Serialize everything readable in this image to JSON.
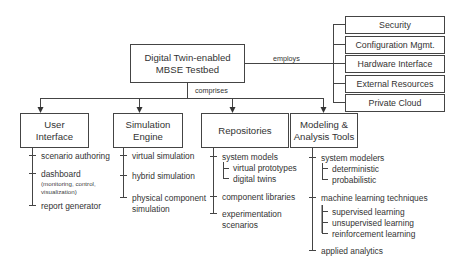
{
  "root": {
    "title_line1": "Digital Twin-enabled",
    "title_line2": "MBSE Testbed"
  },
  "relations": {
    "employs": "employs",
    "comprises": "comprises"
  },
  "employs_items": [
    {
      "label": "Security"
    },
    {
      "label": "Configuration Mgmt."
    },
    {
      "label": "Hardware Interface"
    },
    {
      "label": "External Resources"
    },
    {
      "label": "Private Cloud"
    }
  ],
  "components": [
    {
      "title_line1": "User",
      "title_line2": "Interface",
      "items": [
        {
          "label": "scenario authoring"
        },
        {
          "label": "dashboard",
          "note_line1": "(monitoring, control,",
          "note_line2": "visualization)"
        },
        {
          "label": "report generator"
        }
      ]
    },
    {
      "title_line1": "Simulation",
      "title_line2": "Engine",
      "items": [
        {
          "label": "virtual simulation"
        },
        {
          "label": "hybrid simulation"
        },
        {
          "label": "physical component",
          "label_line2": "simulation"
        }
      ]
    },
    {
      "title_line1": "Repositories",
      "items": [
        {
          "label": "system models",
          "children": [
            {
              "label": "virtual prototypes"
            },
            {
              "label": "digital twins"
            }
          ]
        },
        {
          "label": "component libraries"
        },
        {
          "label": "experimentation",
          "label_line2": "scenarios"
        }
      ]
    },
    {
      "title_line1": "Modeling &",
      "title_line2": "Analysis Tools",
      "items": [
        {
          "label": "system modelers",
          "children": [
            {
              "label": "deterministic"
            },
            {
              "label": "probabilistic"
            }
          ]
        },
        {
          "label": "machine learning techniques",
          "children": [
            {
              "label": "supervised learning"
            },
            {
              "label": "unsupervised learning"
            },
            {
              "label": "reinforcement learning"
            }
          ]
        },
        {
          "label": "applied analytics"
        }
      ]
    }
  ]
}
